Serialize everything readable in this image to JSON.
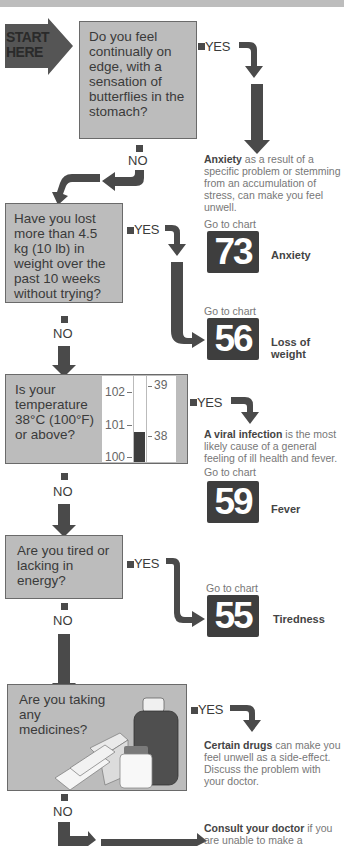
{
  "start": {
    "line1": "START",
    "line2": "HERE"
  },
  "questions": [
    {
      "id": "q1",
      "text": "Do you feel continually on edge, with a sensation of butterflies in the stomach?"
    },
    {
      "id": "q2",
      "text": "Have you lost more than 4.5 kg (10 lb) in weight over the past 10 weeks without trying?"
    },
    {
      "id": "q3",
      "text": "Is your temperature 38°C (100°F) or above?"
    },
    {
      "id": "q4",
      "text": "Are you tired or lacking in energy?"
    },
    {
      "id": "q5",
      "text": "Are you taking any medicines?"
    }
  ],
  "labels": {
    "yes": "YES",
    "no": "NO",
    "goto": "Go to chart"
  },
  "thermometer": {
    "fahrenheit_ticks": [
      "102",
      "101",
      "100"
    ],
    "celsius_ticks": [
      "39",
      "38"
    ]
  },
  "outcomes": {
    "anxiety": {
      "bold": "Anxiety",
      "rest": " as a result of a specific problem or stemming from an accumulation of stress, can make you feel unwell."
    },
    "viral": {
      "bold": "A viral infection",
      "rest": " is the most likely cause of a general feeling of ill health and fever."
    },
    "drugs": {
      "bold": "Certain drugs",
      "rest": " can make you feel unwell as a side-effect. Discuss the problem with your doctor."
    },
    "doctor": {
      "bold": "Consult your doctor",
      "rest": " if you are unable to make a"
    }
  },
  "charts": [
    {
      "number": "73",
      "name": "Anxiety"
    },
    {
      "number": "56",
      "name": "Loss of weight"
    },
    {
      "number": "59",
      "name": "Fever"
    },
    {
      "number": "55",
      "name": "Tiredness"
    }
  ],
  "colors": {
    "box_fill": "#bcbcbc",
    "arrow": "#4a4a4a",
    "chart_box": "#3e3e3e",
    "start_arrow": "#555555"
  }
}
